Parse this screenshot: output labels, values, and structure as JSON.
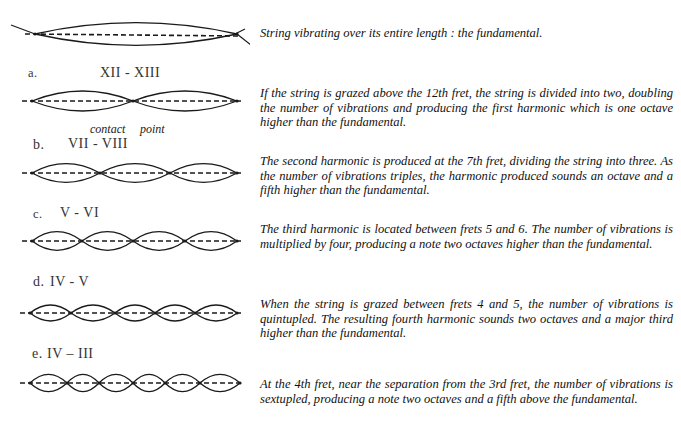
{
  "sections": [
    {
      "id": "fundamental",
      "marker": "",
      "frets": "",
      "description": "String vibrating over its entire length : the fundamental.",
      "nodes_x": [
        35,
        237
      ],
      "axis_y": 34,
      "amplitude": 17
    },
    {
      "id": "a",
      "marker": "a.",
      "frets": "XII - XIII",
      "description": "If the string is grazed above the 12th fret, the string is divided into two, doubling the number of vibrations and producing the first harmonic which is one octave higher than the fundamental.",
      "nodes_x": [
        32,
        133,
        237
      ],
      "axis_y": 101,
      "amplitude": 15
    },
    {
      "id": "b",
      "marker": "b.",
      "frets": "VII - VIII",
      "description": "The second harmonic is produced at the 7th fret, dividing the string into three. As the number of vibrations triples, the harmonic produced sounds an octave and a fifth higher than the fundamental.",
      "nodes_x": [
        32,
        100,
        170,
        237
      ],
      "axis_y": 173,
      "amplitude": 14
    },
    {
      "id": "c",
      "marker": "c.",
      "frets": "V - VI",
      "description": "The third harmonic is located between frets 5 and 6. The number of vibrations is multiplied by four, producing a note two octaves higher than the fundamental.",
      "nodes_x": [
        32,
        82,
        133,
        185,
        237
      ],
      "axis_y": 241,
      "amplitude": 14
    },
    {
      "id": "d",
      "marker": "d.",
      "frets": "IV - V",
      "description": "When the string is grazed between frets 4 and 5, the number of vibrations is quintupled. The resulting fourth harmonic sounds two octaves and a major third higher than the fundamental.",
      "nodes_x": [
        30,
        71,
        115,
        155,
        195,
        237
      ],
      "axis_y": 313,
      "amplitude": 12
    },
    {
      "id": "e",
      "marker": "e.",
      "frets": "IV – III",
      "description": "At the 4th fret, near the separation from the 3rd fret, the number of vibrations is sextupled, producing a note two octaves and a fifth above the fundamental.",
      "nodes_x": [
        30,
        67,
        99,
        133,
        165,
        200,
        240
      ],
      "axis_y": 383,
      "amplitude": 13
    }
  ],
  "annotations": {
    "contact": "contact",
    "point": "point"
  },
  "style": {
    "stroke": "#1a1a1a",
    "text": "#111111",
    "background": "#ffffff"
  }
}
